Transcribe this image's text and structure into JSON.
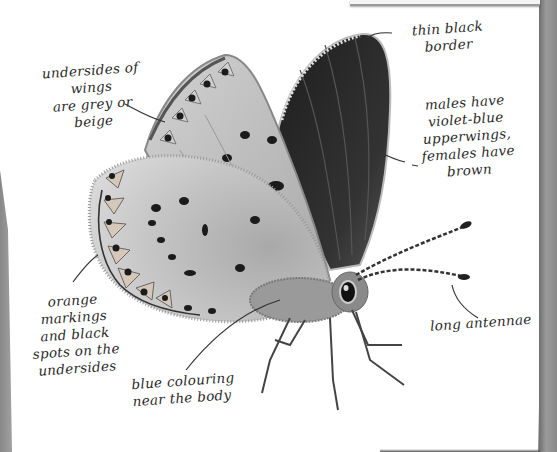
{
  "figure": {
    "palette": {
      "paper": "#ffffff",
      "ink": "#2a2a2a",
      "underwing": "#c9c9c9",
      "upperwing": "#2b2b2b",
      "page_edge": "#8a8a8a"
    }
  },
  "annotations": [
    {
      "id": "thin-black-border",
      "text": "thin black\nborder"
    },
    {
      "id": "underside-colour",
      "text": "undersides of wings\nare grey or beige"
    },
    {
      "id": "upperwing-colour",
      "text": "males have\nviolet-blue\nupperwings,\nfemales have\nbrown"
    },
    {
      "id": "orange-markings",
      "text": "orange\nmarkings\nand black\nspots on the\nundersides"
    },
    {
      "id": "blue-colouring",
      "text": "blue colouring\nnear the body"
    },
    {
      "id": "long-antennae",
      "text": "long antennae"
    }
  ]
}
